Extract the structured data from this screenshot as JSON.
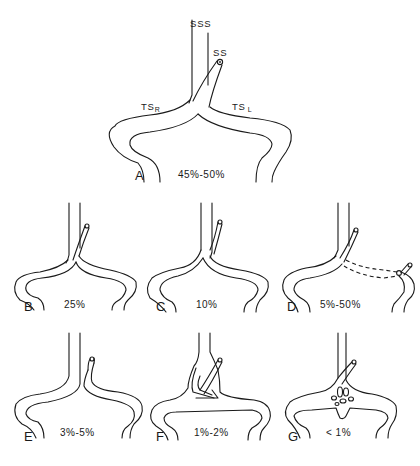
{
  "figure": {
    "labels": {
      "sss": "SSS",
      "ss": "SS",
      "ts_right": "TS",
      "ts_right_sub": "R",
      "ts_left": "TS",
      "ts_left_sub": "L"
    },
    "panels": [
      {
        "letter": "A",
        "percent": "45%-50%",
        "variant": "symmetric confluence"
      },
      {
        "letter": "B",
        "percent": "25%",
        "variant": "right dominant"
      },
      {
        "letter": "C",
        "percent": "10%",
        "variant": "left dominant"
      },
      {
        "letter": "D",
        "percent": "5%-50%",
        "variant": "straight sinus drains to left with hypoplastic connection"
      },
      {
        "letter": "E",
        "percent": "3%-5%",
        "variant": "separate drainage"
      },
      {
        "letter": "F",
        "percent": "1%-2%",
        "variant": "duplicated / triangular confluence"
      },
      {
        "letter": "G",
        "percent": "< 1%",
        "variant": "plexiform confluence"
      }
    ]
  }
}
